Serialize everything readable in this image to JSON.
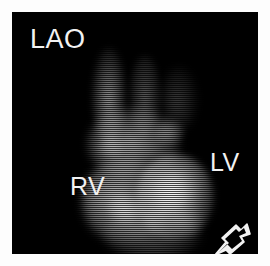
{
  "viewer": {
    "modality": "radionuclide-ventriculography",
    "frame_background": "#000000",
    "border_background": "#ffffff"
  },
  "annotations": {
    "projection_label": "LAO",
    "right_ventricle_label": "RV",
    "left_ventricle_label": "LV",
    "marker_icon": "open-arrow-icon",
    "text_color": "#f2f2f2"
  },
  "regions": [
    {
      "name": "great-vessels",
      "label": "",
      "intensity": "faint"
    },
    {
      "name": "atria",
      "label": "",
      "intensity": "moderate"
    },
    {
      "name": "right-ventricle",
      "label": "RV",
      "intensity": "bright"
    },
    {
      "name": "left-ventricle",
      "label": "LV",
      "intensity": "brightest"
    },
    {
      "name": "apex",
      "label": "",
      "intensity": "moderate"
    }
  ]
}
